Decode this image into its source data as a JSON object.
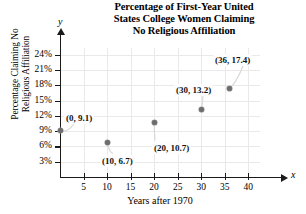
{
  "chart_data": {
    "type": "scatter",
    "title": "Percentage of First-Year United States College Women Claiming No Religious Affiliation",
    "title_lines": [
      "Percentage of First-Year United",
      "States College Women Claiming",
      "No Religious Affiliation"
    ],
    "xlabel": "Years after 1970",
    "ylabel": "Percentage Claiming No Religious Affiliation",
    "ylabel_lines": [
      "Percentage Claiming No",
      "Religious Affiliation"
    ],
    "x_axis_letter": "x",
    "y_axis_letter": "y",
    "xlim": [
      0,
      42
    ],
    "ylim": [
      0,
      25.5
    ],
    "xticks": [
      5,
      10,
      15,
      20,
      25,
      30,
      35,
      40
    ],
    "xtick_labels": [
      "5",
      "10",
      "15",
      "20",
      "25",
      "30",
      "35",
      "40"
    ],
    "yticks": [
      3,
      6,
      9,
      12,
      15,
      18,
      21,
      24
    ],
    "ytick_labels": [
      "3%",
      "6%",
      "9%",
      "12%",
      "15%",
      "18%",
      "21%",
      "24%"
    ],
    "grid": true,
    "legend": null,
    "x": [
      0,
      10,
      20,
      30,
      36
    ],
    "values": [
      9.1,
      6.7,
      10.7,
      13.2,
      17.4
    ],
    "points": [
      {
        "x": 0,
        "y": 9.1,
        "label": "(0, 9.1)"
      },
      {
        "x": 10,
        "y": 6.7,
        "label": "(10, 6.7)"
      },
      {
        "x": 20,
        "y": 10.7,
        "label": "(20, 10.7)"
      },
      {
        "x": 30,
        "y": 13.2,
        "label": "(30, 13.2)"
      },
      {
        "x": 36,
        "y": 17.4,
        "label": "(36, 17.4)"
      }
    ],
    "colors": {
      "point": "#6d6d6d",
      "grid": "#e9e9e9",
      "axis": "#1a1a1a",
      "text": "#000000",
      "background": "#ffffff"
    }
  }
}
